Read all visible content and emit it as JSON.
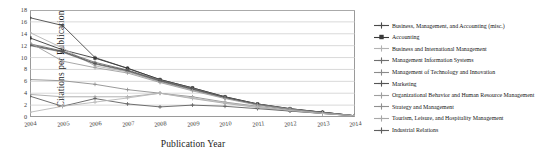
{
  "chart_data": {
    "type": "line",
    "title": "",
    "xlabel": "Publication Year",
    "ylabel": "Citations per Publication",
    "x": [
      2004,
      2005,
      2006,
      2007,
      2008,
      2009,
      2010,
      2011,
      2012,
      2013,
      2014
    ],
    "xlim": [
      2004,
      2014
    ],
    "ylim": [
      0,
      18
    ],
    "yticks": [
      0,
      2,
      4,
      6,
      8,
      10,
      12,
      14,
      16,
      18
    ],
    "xticks": [
      "2004",
      "2005",
      "2006",
      "2007",
      "2008",
      "2009",
      "2010",
      "2011",
      "2012",
      "2013",
      "2014"
    ],
    "grid": "horizontal",
    "legend_position": "right",
    "series": [
      {
        "name": "Business, Management, and Accounting (misc.)",
        "color": "#4a4a4a",
        "marker": "plus",
        "values": [
          16.7,
          15.4,
          10.0,
          8.2,
          6.3,
          4.9,
          3.4,
          2.2,
          1.4,
          0.8,
          0.2
        ]
      },
      {
        "name": "Accounting",
        "color": "#3a3a3a",
        "marker": "square",
        "values": [
          13.3,
          11.3,
          9.9,
          8.2,
          6.3,
          4.9,
          3.4,
          2.2,
          1.4,
          0.8,
          0.2
        ]
      },
      {
        "name": "Business and International Management",
        "color": "#b3b3b3",
        "marker": "plus",
        "values": [
          14.2,
          11.6,
          8.6,
          7.6,
          5.9,
          4.5,
          3.2,
          2.1,
          1.3,
          0.7,
          0.2
        ]
      },
      {
        "name": "Management Information Systems",
        "color": "#6f6f6f",
        "marker": "plus",
        "values": [
          12.3,
          11.1,
          9.2,
          7.9,
          6.2,
          4.8,
          3.3,
          2.1,
          1.3,
          0.8,
          0.2
        ]
      },
      {
        "name": "Management of Technology and Innovation",
        "color": "#8a8a8a",
        "marker": "plus",
        "values": [
          12.0,
          10.9,
          8.9,
          7.7,
          6.0,
          4.6,
          3.2,
          2.1,
          1.3,
          0.7,
          0.2
        ]
      },
      {
        "name": "Marketing",
        "color": "#555555",
        "marker": "plus",
        "values": [
          12.1,
          11.0,
          9.0,
          7.8,
          6.1,
          4.7,
          3.3,
          2.1,
          1.3,
          0.8,
          0.2
        ]
      },
      {
        "name": "Organizational Behavior and Human Resource Management",
        "color": "#9e9e9e",
        "marker": "plus",
        "values": [
          12.5,
          9.4,
          8.3,
          7.4,
          5.8,
          4.4,
          3.1,
          2.0,
          1.3,
          0.7,
          0.2
        ]
      },
      {
        "name": "Strategy and Management",
        "color": "#8f8f8f",
        "marker": "plus",
        "values": [
          6.3,
          6.1,
          5.5,
          4.6,
          4.0,
          3.4,
          2.5,
          1.8,
          1.1,
          0.6,
          0.2
        ]
      },
      {
        "name": "Tourism, Leisure, and Hospitality Management",
        "color": "#a8a8a8",
        "marker": "plus",
        "values": [
          3.8,
          3.4,
          3.4,
          3.4,
          4.0,
          3.1,
          2.3,
          1.6,
          1.0,
          0.6,
          0.2
        ]
      },
      {
        "name": "Industrial Relations",
        "color": "#5f5f5f",
        "marker": "plus",
        "values": [
          3.5,
          1.8,
          3.1,
          2.2,
          1.7,
          2.0,
          1.8,
          1.4,
          1.0,
          0.6,
          0.2
        ]
      },
      {
        "name": "",
        "color": "#b8b8b8",
        "marker": "plus",
        "values": [
          0.8,
          1.8,
          2.5,
          3.2,
          4.0,
          3.2,
          2.4,
          1.7,
          1.1,
          0.6,
          0.2
        ]
      }
    ]
  }
}
